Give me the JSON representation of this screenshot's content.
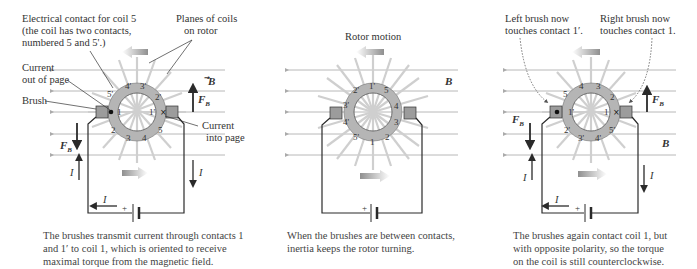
{
  "figure": {
    "panels": [
      {
        "id": "panel-a",
        "annotations": {
          "contact_coil5": [
            "Electrical contact for coil 5",
            "(the coil has two contacts,",
            "numbered 5 and 5'.)"
          ],
          "planes_of_coils": [
            "Planes of coils",
            "on rotor"
          ],
          "current_out": [
            "Current",
            "out of page"
          ],
          "brush": "Brush",
          "current_in": [
            "Current",
            "into page"
          ]
        },
        "ring_labels": [
          "5'",
          "4'",
          "3'",
          "2'",
          "1'",
          "5",
          "4",
          "3",
          "2",
          "1"
        ],
        "vectors": {
          "B": "B",
          "FB_up": "F",
          "FB_down": "F",
          "sub": "B"
        },
        "current_labels": {
          "left": "I",
          "right": "I",
          "bottom": "I"
        },
        "battery_plus": "+",
        "caption": [
          "The brushes transmit current through contacts 1",
          "and 1′ to coil 1, which is oriented to receive",
          "maximal torque from the magnetic field."
        ]
      },
      {
        "id": "panel-b",
        "annotations": {
          "rotor_motion": "Rotor motion"
        },
        "ring_labels": [
          "1'",
          "5",
          "4",
          "3",
          "2",
          "1",
          "5'",
          "4'",
          "3'",
          "2'"
        ],
        "vectors": {
          "B": "B"
        },
        "battery_plus": "+",
        "caption": [
          "When the brushes are between contacts,",
          "inertia keeps the rotor turning."
        ]
      },
      {
        "id": "panel-c",
        "annotations": {
          "left_brush": [
            "Left brush now",
            "touches contact 1′."
          ],
          "right_brush": [
            "Right brush now",
            "touches contact 1."
          ]
        },
        "ring_labels": [
          "5",
          "4",
          "3",
          "2",
          "1",
          "5'",
          "4'",
          "3'",
          "2'",
          "1'"
        ],
        "vectors": {
          "B": "B",
          "FB_up": "F",
          "FB_down": "F",
          "sub": "B"
        },
        "current_labels": {
          "left": "I",
          "right": "I",
          "bottom": "I"
        },
        "battery_plus": "+",
        "caption": [
          "The brushes again contact coil 1, but",
          "with opposite polarity, so the torque",
          "on the coil is still counterclockwise."
        ]
      }
    ],
    "colors": {
      "field_line": "#b8b8b8",
      "ring": "#b5b5b5",
      "ring_contact": "#d9d9d9",
      "spoke": "#cfcfcf",
      "wire": "#2a2a2a",
      "motion_arrow": "#9a9a9a"
    }
  }
}
